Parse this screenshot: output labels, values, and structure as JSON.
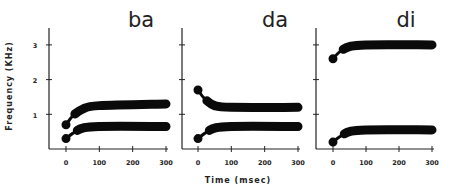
{
  "chart_data": {
    "type": "line",
    "xlabel": "Time (msec)",
    "ylabel": "Frequency (KHz)",
    "xlim": [
      0,
      300
    ],
    "ylim": [
      0,
      3.5
    ],
    "x_ticks": [
      "0",
      "100",
      "200",
      "300"
    ],
    "y_ticks": [
      "1",
      "2",
      "3"
    ],
    "grid": false,
    "panels": [
      {
        "title": "ba",
        "series": [
          {
            "name": "F1",
            "x": [
              0,
              20,
              50,
              100,
              300
            ],
            "y": [
              0.3,
              0.45,
              0.6,
              0.65,
              0.65
            ]
          },
          {
            "name": "F2",
            "x": [
              0,
              20,
              50,
              100,
              300
            ],
            "y": [
              0.7,
              0.95,
              1.15,
              1.25,
              1.3
            ]
          }
        ]
      },
      {
        "title": "da",
        "series": [
          {
            "name": "F1",
            "x": [
              0,
              20,
              50,
              100,
              300
            ],
            "y": [
              0.3,
              0.45,
              0.6,
              0.65,
              0.65
            ]
          },
          {
            "name": "F2",
            "x": [
              0,
              20,
              50,
              100,
              300
            ],
            "y": [
              1.7,
              1.45,
              1.25,
              1.2,
              1.2
            ]
          }
        ]
      },
      {
        "title": "di",
        "series": [
          {
            "name": "F1",
            "x": [
              0,
              20,
              50,
              100,
              300
            ],
            "y": [
              0.2,
              0.35,
              0.5,
              0.55,
              0.55
            ]
          },
          {
            "name": "F2",
            "x": [
              0,
              20,
              50,
              100,
              300
            ],
            "y": [
              2.6,
              2.8,
              2.95,
              3.0,
              3.0
            ]
          }
        ]
      }
    ]
  },
  "labels": {
    "xlabel": "Time (msec)",
    "ylabel": "Frequency (KHz)",
    "panel_titles": [
      "ba",
      "da",
      "di"
    ],
    "x_ticks": [
      "0",
      "100",
      "200",
      "300"
    ],
    "y_ticks": [
      "1",
      "2",
      "3"
    ]
  }
}
